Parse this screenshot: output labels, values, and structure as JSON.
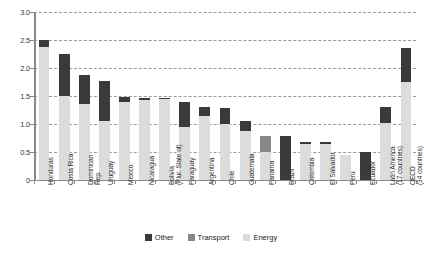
{
  "chart_data": {
    "type": "bar",
    "subtype": "stacked-vertical",
    "title": "",
    "subtitle": "",
    "xlabel": "",
    "ylabel": "",
    "ylim": [
      0,
      3.0
    ],
    "yticks": [
      "0",
      "0.5",
      "1.0",
      "1.5",
      "2.0",
      "2.5",
      "3.0"
    ],
    "ytick_values": [
      0,
      0.5,
      1.0,
      1.5,
      2.0,
      2.5,
      3.0
    ],
    "grid": true,
    "grid_style": "dashed-horizontal",
    "legend_position": "bottom-center",
    "categories": [
      "Honduras",
      "Costa Rica",
      "Dominican Rep.",
      "Uruguay",
      "Mexico",
      "Nicaragua",
      "Bolivia (Plur. State of)",
      "Paraguay",
      "Argentina",
      "Chile",
      "Guatemala",
      "Panama",
      "Brazil",
      "Colombia",
      "El Salvador",
      "Peru",
      "Ecuador",
      "Latin America (17 countries)",
      "OECD (34 countries)"
    ],
    "category_lines": [
      [
        "Honduras"
      ],
      [
        "Costa Rica"
      ],
      [
        "Dominican",
        "Rep."
      ],
      [
        "Uruguay"
      ],
      [
        "Mexico"
      ],
      [
        "Nicaragua"
      ],
      [
        "Bolivia",
        "(Plur. State of)"
      ],
      [
        "Paraguay"
      ],
      [
        "Argentina"
      ],
      [
        "Chile"
      ],
      [
        "Guatemala"
      ],
      [
        "Panama"
      ],
      [
        "Brazil"
      ],
      [
        "Colombia"
      ],
      [
        "El Salvador"
      ],
      [
        "Peru"
      ],
      [
        "Ecuador"
      ],
      [
        "Latin America",
        "(17 countries)"
      ],
      [
        "OECD",
        "(34 countries)"
      ]
    ],
    "series": [
      {
        "name": "Energy",
        "color": "#dcdcdc",
        "values": [
          2.38,
          1.5,
          1.35,
          1.05,
          1.4,
          1.42,
          1.45,
          0.95,
          1.15,
          1.0,
          0.87,
          0.5,
          0.0,
          0.65,
          0.65,
          0.45,
          0.0,
          1.02,
          1.75
        ]
      },
      {
        "name": "Transport",
        "color": "#888888",
        "values": [
          0.0,
          0.0,
          0.0,
          0.0,
          0.0,
          0.0,
          0.0,
          0.0,
          0.0,
          0.0,
          0.0,
          0.28,
          0.0,
          0.0,
          0.0,
          0.0,
          0.0,
          0.0,
          0.0
        ]
      },
      {
        "name": "Other",
        "color": "#3a3a3a",
        "values": [
          0.12,
          0.75,
          0.53,
          0.72,
          0.08,
          0.05,
          0.02,
          0.45,
          0.15,
          0.28,
          0.18,
          0.0,
          0.78,
          0.03,
          0.03,
          0.0,
          0.5,
          0.28,
          0.6
        ]
      }
    ],
    "totals": [
      2.5,
      2.25,
      1.88,
      1.77,
      1.48,
      1.47,
      1.47,
      1.4,
      1.3,
      1.28,
      1.05,
      0.78,
      0.78,
      0.68,
      0.68,
      0.45,
      0.5,
      1.3,
      2.35
    ]
  },
  "legend": {
    "items": [
      {
        "label": "Other",
        "color": "#3a3a3a"
      },
      {
        "label": "Transport",
        "color": "#888888"
      },
      {
        "label": "Energy",
        "color": "#dcdcdc"
      }
    ]
  }
}
